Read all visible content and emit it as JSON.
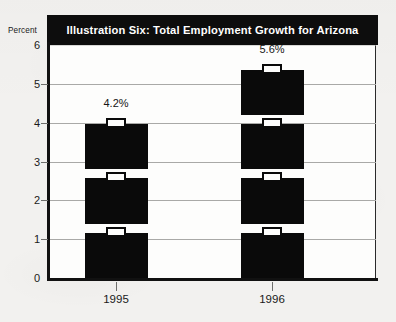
{
  "chart_data": {
    "type": "bar",
    "title": "Illustration Six: Total Employment Growth for Arizona",
    "xlabel": "",
    "ylabel": "Percent",
    "categories": [
      "1995",
      "1996"
    ],
    "values": [
      4.2,
      5.6
    ],
    "data_labels": [
      "4.2%",
      "5.6%"
    ],
    "ylim": [
      0,
      6
    ],
    "ytick_values": [
      0,
      1,
      2,
      3,
      4,
      5,
      6
    ],
    "ytick_labels": [
      "0",
      "1",
      "2",
      "3",
      "4",
      "5",
      "6"
    ],
    "grid": "horizontal",
    "gridline_values": [
      1,
      2,
      3,
      4,
      5
    ],
    "legend": "none",
    "bar_style": "briefcase-pictogram-stack",
    "pictogram_counts": [
      3,
      4
    ],
    "pictogram_unit_value": 1.4,
    "series": [
      {
        "name": "Total Employment Growth",
        "values": [
          4.2,
          5.6
        ]
      }
    ]
  },
  "colors": {
    "bar_fill": "#0a0a0a",
    "title_bar_background": "#0d0d0d",
    "title_text": "#ffffff",
    "plot_background": "#fdfdfc",
    "page_background": "#f2f1ef",
    "gridline": "#a9a9a7",
    "axis_line": "#111111",
    "tick_label": "#1a1a1a"
  }
}
